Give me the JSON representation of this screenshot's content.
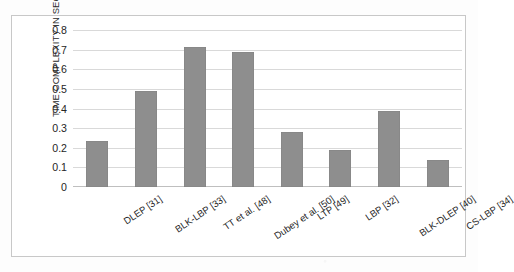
{
  "chart_data": {
    "type": "bar",
    "title": "",
    "xlabel": "",
    "ylabel": "TIME COMPLEXITY IN SECONDS",
    "ylim": [
      0,
      0.8
    ],
    "ytick_labels": [
      "0.8",
      "0.7",
      "0.6",
      "0.5",
      "0.4",
      "0.3",
      "0.2",
      "0.1",
      "0"
    ],
    "ytick_values": [
      0.8,
      0.7,
      0.6,
      0.5,
      0.4,
      0.3,
      0.2,
      0.1,
      0
    ],
    "grid": true,
    "legend": "none",
    "categories": [
      "DLEP [31]",
      "BLK-LBP [33]",
      "TT et al. [48]",
      "Dubey et al. [50]",
      "LTP [49]",
      "LBP [32]",
      "BLK-DLEP [40]",
      "CS-LBP [34]"
    ],
    "values": [
      0.235,
      0.49,
      0.715,
      0.69,
      0.28,
      0.19,
      0.385,
      0.14
    ],
    "bar_color": "#8e8e8e",
    "gridline_color": "#d9d9d9",
    "frame_color": "#c8c8c8",
    "background_color": "#ffffff"
  }
}
